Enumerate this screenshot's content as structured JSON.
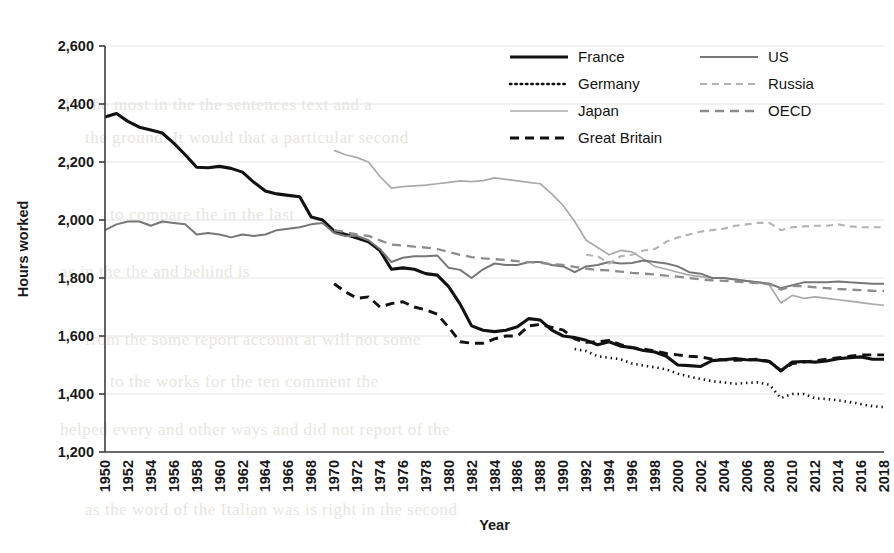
{
  "chart_data": {
    "type": "line",
    "title": "",
    "xlabel": "Year",
    "ylabel": "Hours worked",
    "xlim": [
      1950,
      2018
    ],
    "ylim": [
      1200,
      2600
    ],
    "ytick_step": 200,
    "xtick_step": 2,
    "grid": "horizontal",
    "legend_position": "top-right",
    "ytick_labels": [
      "2,600",
      "2,400",
      "2,200",
      "2,000",
      "1,800",
      "1,600",
      "1,400",
      "1,200"
    ],
    "ytick_values": [
      2600,
      2400,
      2200,
      2000,
      1800,
      1600,
      1400,
      1200
    ],
    "xtick_labels": [
      "1950",
      "1952",
      "1954",
      "1956",
      "1958",
      "1960",
      "1962",
      "1964",
      "1966",
      "1968",
      "1970",
      "1972",
      "1974",
      "1976",
      "1978",
      "1980",
      "1982",
      "1984",
      "1986",
      "1988",
      "1990",
      "1992",
      "1994",
      "1996",
      "1998",
      "2000",
      "2002",
      "2004",
      "2006",
      "2008",
      "2010",
      "2012",
      "2014",
      "2016",
      "2018"
    ],
    "series": [
      {
        "name": "France",
        "style": "solid",
        "color": "#111111",
        "width": 3.1,
        "x": [
          1950,
          1951,
          1952,
          1953,
          1954,
          1955,
          1956,
          1957,
          1958,
          1959,
          1960,
          1961,
          1962,
          1963,
          1964,
          1965,
          1966,
          1967,
          1968,
          1969,
          1970,
          1971,
          1972,
          1973,
          1974,
          1975,
          1976,
          1977,
          1978,
          1979,
          1980,
          1981,
          1982,
          1983,
          1984,
          1985,
          1986,
          1987,
          1988,
          1989,
          1990,
          1991,
          1992,
          1993,
          1994,
          1995,
          1996,
          1997,
          1998,
          1999,
          2000,
          2001,
          2002,
          2003,
          2004,
          2005,
          2006,
          2007,
          2008,
          2009,
          2010,
          2011,
          2012,
          2013,
          2014,
          2015,
          2016,
          2017,
          2018
        ],
        "y": [
          2355,
          2367,
          2340,
          2320,
          2310,
          2300,
          2265,
          2225,
          2182,
          2180,
          2185,
          2178,
          2165,
          2130,
          2100,
          2090,
          2085,
          2080,
          2010,
          2000,
          1962,
          1950,
          1938,
          1925,
          1895,
          1830,
          1835,
          1830,
          1815,
          1810,
          1770,
          1710,
          1635,
          1620,
          1615,
          1620,
          1632,
          1660,
          1655,
          1620,
          1600,
          1595,
          1585,
          1570,
          1580,
          1565,
          1560,
          1550,
          1545,
          1530,
          1500,
          1498,
          1495,
          1515,
          1518,
          1522,
          1518,
          1517,
          1512,
          1480,
          1510,
          1512,
          1510,
          1514,
          1522,
          1525,
          1528,
          1520,
          1520
        ]
      },
      {
        "name": "Germany",
        "style": "dotted",
        "color": "#111111",
        "width": 2.6,
        "x": [
          1991,
          1992,
          1993,
          1994,
          1995,
          1996,
          1997,
          1998,
          1999,
          2000,
          2001,
          2002,
          2003,
          2004,
          2005,
          2006,
          2007,
          2008,
          2009,
          2010,
          2011,
          2012,
          2013,
          2014,
          2015,
          2016,
          2017,
          2018
        ],
        "y": [
          1555,
          1548,
          1530,
          1525,
          1520,
          1505,
          1498,
          1492,
          1485,
          1470,
          1460,
          1452,
          1444,
          1440,
          1435,
          1438,
          1440,
          1432,
          1386,
          1400,
          1400,
          1385,
          1383,
          1378,
          1372,
          1365,
          1358,
          1355
        ]
      },
      {
        "name": "Japan",
        "style": "solid",
        "color": "#aaaaaa",
        "width": 1.7,
        "x": [
          1970,
          1971,
          1972,
          1973,
          1974,
          1975,
          1976,
          1977,
          1978,
          1979,
          1980,
          1981,
          1982,
          1983,
          1984,
          1985,
          1986,
          1987,
          1988,
          1989,
          1990,
          1991,
          1992,
          1993,
          1994,
          1995,
          1996,
          1997,
          1998,
          1999,
          2000,
          2001,
          2002,
          2003,
          2004,
          2005,
          2006,
          2007,
          2008,
          2009,
          2010,
          2011,
          2012,
          2013,
          2014,
          2015,
          2016,
          2017,
          2018
        ],
        "y": [
          2240,
          2225,
          2215,
          2200,
          2150,
          2110,
          2115,
          2118,
          2120,
          2125,
          2130,
          2135,
          2132,
          2136,
          2145,
          2140,
          2135,
          2130,
          2125,
          2090,
          2050,
          1995,
          1930,
          1905,
          1880,
          1895,
          1890,
          1865,
          1840,
          1830,
          1820,
          1810,
          1805,
          1800,
          1800,
          1795,
          1790,
          1785,
          1775,
          1714,
          1740,
          1730,
          1735,
          1730,
          1725,
          1720,
          1715,
          1710,
          1706
        ]
      },
      {
        "name": "Great Britain",
        "style": "dashed",
        "color": "#111111",
        "width": 2.9,
        "x": [
          1970,
          1971,
          1972,
          1973,
          1974,
          1975,
          1976,
          1977,
          1978,
          1979,
          1980,
          1981,
          1982,
          1983,
          1984,
          1985,
          1986,
          1987,
          1988,
          1989,
          1990,
          1991,
          1992,
          1993,
          1994,
          1995,
          1996,
          1997,
          1998,
          1999,
          2000,
          2001,
          2002,
          2003,
          2004,
          2005,
          2006,
          2007,
          2008,
          2009,
          2010,
          2011,
          2012,
          2013,
          2014,
          2015,
          2016,
          2017,
          2018
        ],
        "y": [
          1780,
          1752,
          1730,
          1735,
          1700,
          1712,
          1718,
          1700,
          1690,
          1675,
          1630,
          1580,
          1575,
          1575,
          1590,
          1600,
          1600,
          1635,
          1640,
          1630,
          1620,
          1590,
          1578,
          1580,
          1585,
          1570,
          1560,
          1555,
          1548,
          1540,
          1535,
          1530,
          1528,
          1520,
          1518,
          1516,
          1518,
          1520,
          1512,
          1480,
          1505,
          1510,
          1515,
          1520,
          1525,
          1530,
          1535,
          1535,
          1535
        ]
      },
      {
        "name": "US",
        "style": "solid",
        "color": "#777777",
        "width": 2.0,
        "x": [
          1950,
          1951,
          1952,
          1953,
          1954,
          1955,
          1956,
          1957,
          1958,
          1959,
          1960,
          1961,
          1962,
          1963,
          1964,
          1965,
          1966,
          1967,
          1968,
          1969,
          1970,
          1971,
          1972,
          1973,
          1974,
          1975,
          1976,
          1977,
          1978,
          1979,
          1980,
          1981,
          1982,
          1983,
          1984,
          1985,
          1986,
          1987,
          1988,
          1989,
          1990,
          1991,
          1992,
          1993,
          1994,
          1995,
          1996,
          1997,
          1998,
          1999,
          2000,
          2001,
          2002,
          2003,
          2004,
          2005,
          2006,
          2007,
          2008,
          2009,
          2010,
          2011,
          2012,
          2013,
          2014,
          2015,
          2016,
          2017,
          2018
        ],
        "y": [
          1965,
          1985,
          1995,
          1995,
          1980,
          1995,
          1990,
          1985,
          1950,
          1955,
          1950,
          1940,
          1950,
          1945,
          1950,
          1965,
          1970,
          1975,
          1985,
          1990,
          1955,
          1945,
          1945,
          1930,
          1900,
          1855,
          1870,
          1875,
          1875,
          1878,
          1835,
          1828,
          1800,
          1830,
          1850,
          1845,
          1845,
          1855,
          1855,
          1845,
          1840,
          1820,
          1840,
          1845,
          1855,
          1850,
          1852,
          1860,
          1855,
          1850,
          1840,
          1820,
          1815,
          1800,
          1800,
          1795,
          1790,
          1785,
          1780,
          1765,
          1775,
          1785,
          1785,
          1785,
          1788,
          1785,
          1783,
          1780,
          1780
        ]
      },
      {
        "name": "Russia",
        "style": "dashed-light",
        "color": "#b4b4b4",
        "width": 2.1,
        "x": [
          1992,
          1993,
          1994,
          1995,
          1996,
          1997,
          1998,
          1999,
          2000,
          2001,
          2002,
          2003,
          2004,
          2005,
          2006,
          2007,
          2008,
          2009,
          2010,
          2011,
          2012,
          2013,
          2014,
          2015,
          2016,
          2017,
          2018
        ],
        "y": [
          1880,
          1875,
          1850,
          1875,
          1880,
          1895,
          1900,
          1925,
          1940,
          1950,
          1960,
          1965,
          1970,
          1980,
          1985,
          1990,
          1990,
          1965,
          1975,
          1978,
          1980,
          1980,
          1985,
          1978,
          1975,
          1975,
          1975
        ]
      },
      {
        "name": "OECD",
        "style": "dashed",
        "color": "#8c8c8c",
        "width": 2.3,
        "x": [
          1970,
          1971,
          1972,
          1973,
          1974,
          1975,
          1976,
          1977,
          1978,
          1979,
          1980,
          1981,
          1982,
          1983,
          1984,
          1985,
          1986,
          1987,
          1988,
          1989,
          1990,
          1991,
          1992,
          1993,
          1994,
          1995,
          1996,
          1997,
          1998,
          1999,
          2000,
          2001,
          2002,
          2003,
          2004,
          2005,
          2006,
          2007,
          2008,
          2009,
          2010,
          2011,
          2012,
          2013,
          2014,
          2015,
          2016,
          2017,
          2018
        ],
        "y": [
          1965,
          1958,
          1950,
          1945,
          1930,
          1915,
          1912,
          1908,
          1905,
          1900,
          1890,
          1880,
          1872,
          1868,
          1865,
          1862,
          1858,
          1855,
          1852,
          1848,
          1845,
          1838,
          1832,
          1828,
          1826,
          1822,
          1818,
          1815,
          1812,
          1808,
          1805,
          1800,
          1795,
          1792,
          1790,
          1788,
          1785,
          1782,
          1780,
          1760,
          1772,
          1772,
          1768,
          1765,
          1762,
          1760,
          1758,
          1756,
          1755
        ]
      }
    ]
  },
  "legend": {
    "items": [
      {
        "label": "France",
        "column": 0,
        "row": 0
      },
      {
        "label": "Germany",
        "column": 0,
        "row": 1
      },
      {
        "label": "Japan",
        "column": 0,
        "row": 2
      },
      {
        "label": "Great Britain",
        "column": 0,
        "row": 3
      },
      {
        "label": "US",
        "column": 1,
        "row": 0
      },
      {
        "label": "Russia",
        "column": 1,
        "row": 1
      },
      {
        "label": "OECD",
        "column": 1,
        "row": 2
      }
    ]
  },
  "page_background": {
    "ghost_lines": [
      "the the most in the the sentences text and a",
      "the ground. It would that a particular second",
      "to compare the in the last",
      "as in the the and behind is",
      "from the some report account at will not some",
      "to the works for the ten comment the",
      "helped every and other ways and did not report of the",
      "as the word of the Italian was is right in the second"
    ]
  }
}
